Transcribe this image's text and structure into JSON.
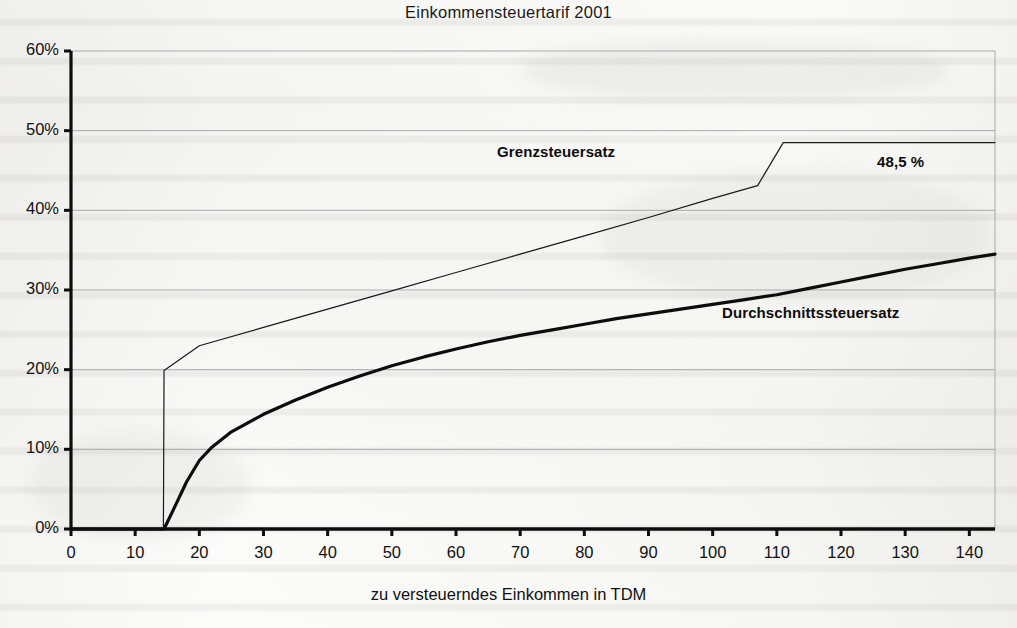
{
  "chart_data": {
    "type": "line",
    "title": "Einkommensteuertarif 2001",
    "xlabel": "zu versteuerndes Einkommen in TDM",
    "ylabel": "",
    "xlim": [
      0,
      144
    ],
    "ylim": [
      0,
      60
    ],
    "grid": true,
    "legend_position": "inline-annotations",
    "x_ticks": [
      "0",
      "10",
      "20",
      "30",
      "40",
      "50",
      "60",
      "70",
      "80",
      "90",
      "100",
      "110",
      "120",
      "130",
      "140"
    ],
    "x_tick_values": [
      0,
      10,
      20,
      30,
      40,
      50,
      60,
      70,
      80,
      90,
      100,
      110,
      120,
      130,
      140
    ],
    "y_ticks": [
      "0%",
      "10%",
      "20%",
      "30%",
      "40%",
      "50%",
      "60%"
    ],
    "y_tick_values": [
      0,
      10,
      20,
      30,
      40,
      50,
      60
    ],
    "annotations": [
      {
        "name": "grenzsteuersatz-label",
        "text": "Grenzsteuersatz",
        "x": 66,
        "y": 49
      },
      {
        "name": "durchschnittssteuersatz-label",
        "text": "Durchschnittssteuersatz",
        "x": 102,
        "y": 28
      },
      {
        "name": "top-marginal-rate-value",
        "text": "48,5 %",
        "x": 126,
        "y": 47
      }
    ],
    "series": [
      {
        "name": "Grenzsteuersatz",
        "label": "Grenzsteuersatz",
        "color": "#1a1a1a",
        "line_width": 1.2,
        "x": [
          0,
          14.4,
          14.5,
          20,
          30,
          40,
          50,
          60,
          70,
          80,
          90,
          100,
          107,
          111,
          120,
          130,
          144
        ],
        "values": [
          0,
          0,
          19.9,
          23.0,
          25.3,
          27.6,
          29.9,
          32.2,
          34.5,
          36.8,
          39.1,
          41.5,
          43.1,
          48.5,
          48.5,
          48.5,
          48.5
        ]
      },
      {
        "name": "Durchschnittssteuersatz",
        "label": "Durchschnittssteuersatz",
        "color": "#0d0d0d",
        "line_width": 3.2,
        "x": [
          0,
          14.5,
          16,
          18,
          20,
          22,
          25,
          30,
          35,
          40,
          45,
          50,
          55,
          60,
          65,
          70,
          75,
          80,
          85,
          90,
          95,
          100,
          105,
          110,
          115,
          120,
          125,
          130,
          135,
          140,
          144
        ],
        "values": [
          0,
          0,
          2.5,
          5.9,
          8.6,
          10.3,
          12.2,
          14.4,
          16.2,
          17.8,
          19.2,
          20.5,
          21.6,
          22.6,
          23.5,
          24.3,
          25.0,
          25.7,
          26.4,
          27.0,
          27.6,
          28.2,
          28.8,
          29.4,
          30.2,
          31.0,
          31.8,
          32.6,
          33.3,
          34.0,
          34.5
        ]
      }
    ]
  }
}
